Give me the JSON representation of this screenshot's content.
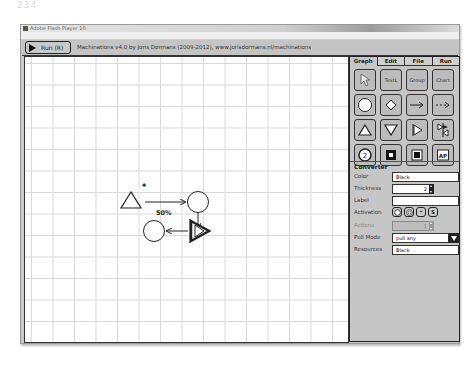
{
  "page_number": "234",
  "window": {
    "title": "Adobe Flash Player 10",
    "menu": [
      "File",
      "View",
      "Control",
      "Help"
    ]
  },
  "toolbar": {
    "run_label": "Run (R)",
    "credits": "Machinations v4.0 by Joris Dormans (2009-2012), www.jorisdormans.nl/machinations"
  },
  "diagram": {
    "source_marker": "*",
    "edge_label": "50%"
  },
  "panel": {
    "tabs": [
      "Graph",
      "Edit",
      "File",
      "Run"
    ],
    "active_tab": "Graph",
    "tools": [
      {
        "name": "select-tool",
        "label": ""
      },
      {
        "name": "text-tool",
        "label": "TextL"
      },
      {
        "name": "group-tool",
        "label": "Group"
      },
      {
        "name": "chart-tool",
        "label": "Chart"
      },
      {
        "name": "pool-tool",
        "label": ""
      },
      {
        "name": "gate-tool",
        "label": ""
      },
      {
        "name": "resource-connection-tool",
        "label": ""
      },
      {
        "name": "state-connection-tool",
        "label": ""
      },
      {
        "name": "source-tool",
        "label": ""
      },
      {
        "name": "drain-tool",
        "label": ""
      },
      {
        "name": "converter-tool",
        "label": ""
      },
      {
        "name": "trader-tool",
        "label": ""
      },
      {
        "name": "register-tool",
        "label": "2"
      },
      {
        "name": "end-condition-tool",
        "label": ""
      },
      {
        "name": "delay-tool",
        "label": ""
      },
      {
        "name": "artificial-player-tool",
        "label": "AP"
      }
    ],
    "properties": {
      "section_title": "Converter",
      "color_label": "Color",
      "color_value": "Black",
      "thickness_label": "Thickness",
      "thickness_value": "2",
      "label_label": "Label",
      "label_value": "",
      "activation_label": "Activation",
      "activation_options": [
        "passive",
        "interactive",
        "automatic",
        "starting"
      ],
      "activation_s": "S",
      "activation_star": "*",
      "actions_label": "Actions",
      "actions_value": "1",
      "pull_mode_label": "Pull Mode",
      "pull_mode_value": "pull any",
      "resources_label": "Resources",
      "resources_value": "Black"
    }
  }
}
